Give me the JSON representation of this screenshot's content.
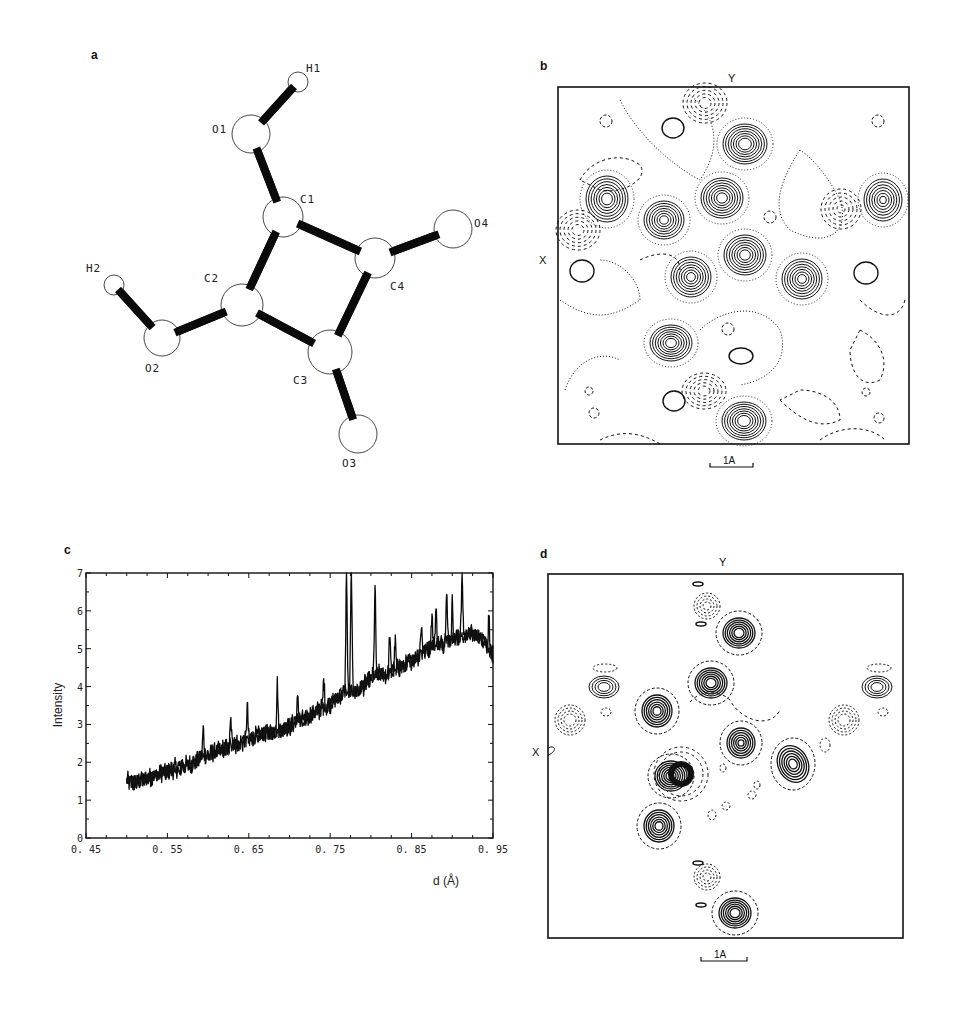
{
  "figure": {
    "panels": {
      "a": {
        "label": "a",
        "description": "Squaric acid molecular structure (ball-and-stick)",
        "atoms": [
          {
            "id": "H1",
            "label": "H1",
            "x": 298,
            "y": 82,
            "r": 10,
            "lx": 306,
            "ly": 62
          },
          {
            "id": "O1",
            "label": "O1",
            "x": 251,
            "y": 134,
            "r": 19,
            "lx": 212,
            "ly": 123
          },
          {
            "id": "C1",
            "label": "C1",
            "x": 283,
            "y": 217,
            "r": 20,
            "lx": 300,
            "ly": 193
          },
          {
            "id": "O4",
            "label": "O4",
            "x": 453,
            "y": 229,
            "r": 19,
            "lx": 474,
            "ly": 217
          },
          {
            "id": "C4",
            "label": "C4",
            "x": 375,
            "y": 258,
            "r": 20,
            "lx": 390,
            "ly": 280
          },
          {
            "id": "C2",
            "label": "C2",
            "x": 242,
            "y": 305,
            "r": 21,
            "lx": 204,
            "ly": 272
          },
          {
            "id": "H2",
            "label": "H2",
            "x": 114,
            "y": 285,
            "r": 10,
            "lx": 86,
            "ly": 262
          },
          {
            "id": "O2",
            "label": "O2",
            "x": 162,
            "y": 338,
            "r": 18,
            "lx": 145,
            "ly": 362
          },
          {
            "id": "C3",
            "label": "C3",
            "x": 330,
            "y": 352,
            "r": 22,
            "lx": 293,
            "ly": 374
          },
          {
            "id": "O3",
            "label": "O3",
            "x": 358,
            "y": 434,
            "r": 19,
            "lx": 342,
            "ly": 457
          }
        ],
        "bonds": [
          [
            "H1",
            "O1"
          ],
          [
            "O1",
            "C1"
          ],
          [
            "C1",
            "C4"
          ],
          [
            "C4",
            "O4"
          ],
          [
            "C1",
            "C2"
          ],
          [
            "C2",
            "C3"
          ],
          [
            "C3",
            "C4"
          ],
          [
            "C2",
            "O2"
          ],
          [
            "O2",
            "H2"
          ],
          [
            "C3",
            "O3"
          ]
        ]
      },
      "b": {
        "label": "b",
        "axis_top": "Y",
        "axis_left": "X",
        "scale_bar": "1A",
        "description": "Contour density map"
      },
      "c": {
        "label": "c"
      },
      "d": {
        "label": "d",
        "axis_top": "Y",
        "axis_left": "X",
        "scale_bar": "1A",
        "description": "Contour density map"
      }
    }
  },
  "chart_data": {
    "type": "line",
    "title": "",
    "xlabel": "d (Å)",
    "ylabel": "Intensity",
    "xlim": [
      0.45,
      0.95
    ],
    "ylim": [
      0,
      7
    ],
    "x_ticks": [
      "0.45",
      "0.55",
      "0.65",
      "0.75",
      "0.85",
      "0.95"
    ],
    "y_ticks": [
      "0",
      "1",
      "2",
      "3",
      "4",
      "5",
      "6",
      "7"
    ],
    "grid": false,
    "legend": null,
    "series": [
      {
        "name": "diffraction pattern",
        "x": [
          0.5,
          0.51,
          0.52,
          0.53,
          0.54,
          0.55,
          0.56,
          0.57,
          0.58,
          0.59,
          0.6,
          0.61,
          0.62,
          0.63,
          0.64,
          0.65,
          0.66,
          0.67,
          0.68,
          0.69,
          0.7,
          0.71,
          0.72,
          0.73,
          0.74,
          0.75,
          0.76,
          0.77,
          0.78,
          0.79,
          0.8,
          0.81,
          0.82,
          0.83,
          0.84,
          0.85,
          0.86,
          0.87,
          0.88,
          0.89,
          0.9,
          0.91,
          0.92,
          0.93,
          0.94,
          0.95
        ],
        "y": [
          1.5,
          1.45,
          1.55,
          1.6,
          1.7,
          1.75,
          1.85,
          1.9,
          1.95,
          2.1,
          2.2,
          2.3,
          2.35,
          2.45,
          2.5,
          2.6,
          2.7,
          2.75,
          2.8,
          2.85,
          2.95,
          3.1,
          3.15,
          3.3,
          3.4,
          3.55,
          3.7,
          3.9,
          3.85,
          4.0,
          4.2,
          4.35,
          4.3,
          4.45,
          4.55,
          4.7,
          4.85,
          5.0,
          5.1,
          5.15,
          5.25,
          5.3,
          5.4,
          5.35,
          5.2,
          4.8
        ]
      }
    ],
    "peaks": [
      {
        "x": 0.594,
        "y": 2.9
      },
      {
        "x": 0.628,
        "y": 3.1
      },
      {
        "x": 0.648,
        "y": 3.5
      },
      {
        "x": 0.685,
        "y": 4.05
      },
      {
        "x": 0.71,
        "y": 3.7
      },
      {
        "x": 0.742,
        "y": 4.2
      },
      {
        "x": 0.77,
        "y": 7.0
      },
      {
        "x": 0.776,
        "y": 7.0
      },
      {
        "x": 0.805,
        "y": 6.6
      },
      {
        "x": 0.823,
        "y": 5.35
      },
      {
        "x": 0.83,
        "y": 5.2
      },
      {
        "x": 0.862,
        "y": 5.7
      },
      {
        "x": 0.875,
        "y": 5.9
      },
      {
        "x": 0.88,
        "y": 6.1
      },
      {
        "x": 0.893,
        "y": 6.65
      },
      {
        "x": 0.9,
        "y": 6.2
      },
      {
        "x": 0.912,
        "y": 7.0
      },
      {
        "x": 0.945,
        "y": 5.8
      }
    ]
  }
}
